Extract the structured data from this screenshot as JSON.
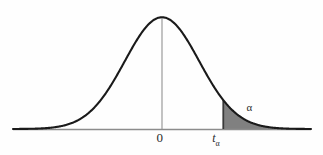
{
  "figure": {
    "background_color": "#fefefe",
    "curve_color": "#1a1a1a",
    "axis_color": "#8c8c8c",
    "center_line_color": "#9a9a9a",
    "shade_color": "#808080",
    "label_color": "#2b2b2b"
  },
  "labels": {
    "center": "0",
    "critical_value": "t",
    "critical_value_subscript": "α",
    "tail_area": "α"
  },
  "chart_data": {
    "type": "area",
    "title": "",
    "subtitle": "",
    "xlabel": "",
    "ylabel": "",
    "grid": false,
    "legend_position": "none",
    "axis_ranges": {
      "x": [
        -4.0,
        4.0
      ],
      "y": [
        0,
        0.42
      ]
    },
    "distribution": "standard normal (bell curve)",
    "mean": 0,
    "std_dev": 1,
    "tick_labels": [
      "0",
      "tα"
    ],
    "tick_x_values": [
      0,
      1.645
    ],
    "annotations": [
      {
        "text": "0",
        "x": 0,
        "y": 0,
        "role": "x-axis-tick-center"
      },
      {
        "text": "tα",
        "x": 1.645,
        "y": 0,
        "role": "x-axis-tick-critical-value"
      },
      {
        "text": "α",
        "x": 2.35,
        "y": 0.045,
        "role": "shaded-tail-area-label"
      }
    ],
    "shaded_region": {
      "from_x": 1.645,
      "to_x": 4.0,
      "fill": "#808080",
      "meaning": "upper tail area equal to alpha"
    },
    "x": [
      -4.0,
      -3.75,
      -3.5,
      -3.25,
      -3.0,
      -2.75,
      -2.5,
      -2.25,
      -2.0,
      -1.75,
      -1.5,
      -1.25,
      -1.0,
      -0.75,
      -0.5,
      -0.25,
      0.0,
      0.25,
      0.5,
      0.75,
      1.0,
      1.25,
      1.5,
      1.75,
      2.0,
      2.25,
      2.5,
      2.75,
      3.0,
      3.25,
      3.5,
      3.75,
      4.0
    ],
    "y": [
      0.0001,
      0.0004,
      0.0009,
      0.002,
      0.0044,
      0.0091,
      0.0175,
      0.0317,
      0.054,
      0.0863,
      0.1295,
      0.1826,
      0.242,
      0.3011,
      0.3521,
      0.3867,
      0.3989,
      0.3867,
      0.3521,
      0.3011,
      0.242,
      0.1826,
      0.1295,
      0.0863,
      0.054,
      0.0317,
      0.0175,
      0.0091,
      0.0044,
      0.002,
      0.0009,
      0.0004,
      0.0001
    ],
    "vertical_lines": [
      {
        "x": 0,
        "from_y": 0,
        "to_y": 0.3989,
        "role": "center-axis-of-symmetry"
      },
      {
        "x": 1.645,
        "from_y": 0,
        "to_y": 0.1031,
        "role": "critical-value-boundary"
      }
    ]
  }
}
